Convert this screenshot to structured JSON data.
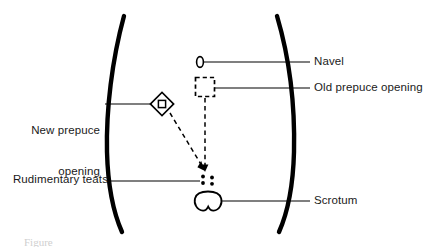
{
  "figure": {
    "background_color": "#ffffff",
    "ink_color": "#000000",
    "caption_partial": "Figure"
  },
  "labels": {
    "new_prepuce_opening_line1": "New prepuce",
    "new_prepuce_opening_line2": "opening",
    "rudimentary_teats": "Rudimentary teats",
    "navel": "Navel",
    "old_prepuce_opening": "Old prepuce opening",
    "scrotum": "Scrotum"
  },
  "structures": [
    {
      "name": "navel",
      "symbol": "small-vertical-ellipse-outline",
      "x": 200,
      "y": 62
    },
    {
      "name": "old-prepuce-opening",
      "symbol": "dashed-square-outline",
      "x": 205,
      "y": 88
    },
    {
      "name": "new-prepuce-opening",
      "symbol": "diamond-with-inner-diamond",
      "x": 162,
      "y": 104
    },
    {
      "name": "rudimentary-teats",
      "symbol": "four-dots-2x2-grid",
      "x": 207,
      "y": 180,
      "count": 4
    },
    {
      "name": "scrotum",
      "symbol": "bilobed-outline",
      "x": 208,
      "y": 201
    }
  ],
  "body_outline": {
    "left_flank": "curve-convex-left",
    "right_flank": "curve-convex-right",
    "stroke_width": 4
  },
  "relocation_arrows": {
    "from_old_opening": "dashed-vertical-down-to-arrowhead",
    "from_new_opening": "dashed-diagonal-down-right-to-arrowhead",
    "arrowhead_x": 206,
    "arrowhead_y": 172
  }
}
